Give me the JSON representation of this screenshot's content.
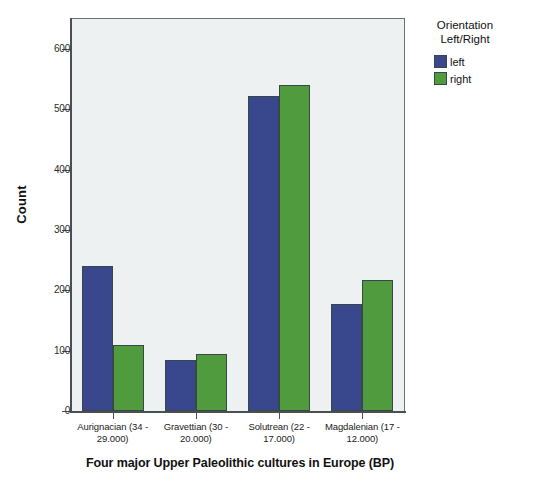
{
  "chart_data": {
    "type": "bar",
    "title": "",
    "subtitle": "",
    "xlabel": "Four major Upper Paleolithic cultures in Europe (BP)",
    "ylabel": "Count",
    "ylim": [
      0,
      650
    ],
    "yticks": [
      0,
      100,
      200,
      300,
      400,
      500,
      600
    ],
    "ytick_labels": [
      "0",
      "100",
      "200",
      "300",
      "400",
      "500",
      "600"
    ],
    "grid": false,
    "legend_position": "right",
    "legend_title": "Orientation Left/Right",
    "categories": [
      "Aurignacian (34 - 29.000)",
      "Gravettian (30 - 20.000)",
      "Solutrean (22 - 17.000)",
      "Magdalenian (17 - 12.000)"
    ],
    "series": [
      {
        "name": "left",
        "color": "#39488c",
        "values": [
          241,
          85,
          522,
          178
        ]
      },
      {
        "name": "right",
        "color": "#4f9b3d",
        "values": [
          109,
          95,
          540,
          218
        ]
      }
    ]
  },
  "legend": {
    "title_line1": "Orientation",
    "title_line2": "Left/Right",
    "items": [
      {
        "label": "left"
      },
      {
        "label": "right"
      }
    ]
  },
  "axes": {
    "y_title": "Count",
    "x_title": "Four major Upper Paleolithic cultures in Europe (BP)",
    "y_tick_labels": [
      "600",
      "500",
      "400",
      "300",
      "200",
      "100",
      "0"
    ]
  },
  "category_labels": [
    {
      "line1": "Aurignacian (34 -",
      "line2": "29.000)"
    },
    {
      "line1": "Gravettian (30 -",
      "line2": "20.000)"
    },
    {
      "line1": "Solutrean (22 -",
      "line2": "17.000)"
    },
    {
      "line1": "Magdalenian (17 -",
      "line2": "12.000)"
    }
  ],
  "colors": {
    "left": "#39488c",
    "right": "#4f9b3d",
    "plot_background": "#eef1f2",
    "axis": "#4a4f51",
    "page_background": "#ffffff"
  }
}
